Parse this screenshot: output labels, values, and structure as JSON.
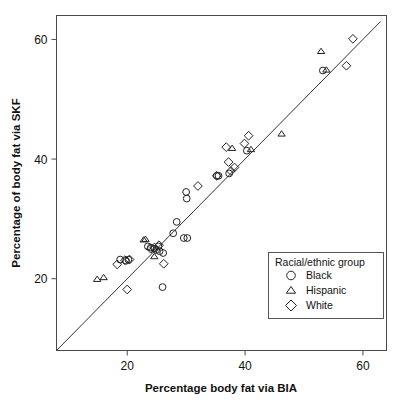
{
  "chart_data": {
    "type": "scatter",
    "title": "",
    "xlabel": "Percentage body fat via BIA",
    "ylabel": "Percentage of body fat via SKF",
    "xlim": [
      8,
      64
    ],
    "ylim": [
      8,
      64
    ],
    "xticks": [
      20,
      40,
      60
    ],
    "yticks": [
      20,
      40,
      60
    ],
    "xtick_labels": [
      "20",
      "40",
      "60"
    ],
    "ytick_labels": [
      "20",
      "40",
      "60"
    ],
    "grid": false,
    "reference_line": {
      "type": "identity",
      "label": "y = x",
      "from": [
        8,
        8
      ],
      "to": [
        63,
        63
      ]
    },
    "legend": {
      "title": "Racial/ethnic group",
      "position": "bottom-right",
      "entries": [
        {
          "name": "Black",
          "marker": "circle"
        },
        {
          "name": "Hispanic",
          "marker": "triangle"
        },
        {
          "name": "White",
          "marker": "diamond"
        }
      ]
    },
    "series": [
      {
        "name": "Black",
        "marker": "circle",
        "points": [
          [
            18.8,
            23.2
          ],
          [
            19.8,
            23.0
          ],
          [
            20.2,
            23.2
          ],
          [
            23.5,
            25.4
          ],
          [
            24.0,
            25.2
          ],
          [
            24.6,
            25.0
          ],
          [
            24.9,
            24.8
          ],
          [
            25.3,
            25.4
          ],
          [
            25.5,
            24.6
          ],
          [
            26.1,
            24.3
          ],
          [
            26.0,
            18.6
          ],
          [
            27.8,
            27.6
          ],
          [
            28.4,
            29.5
          ],
          [
            29.6,
            26.8
          ],
          [
            30.2,
            26.8
          ],
          [
            30.0,
            34.5
          ],
          [
            30.1,
            33.4
          ],
          [
            35.2,
            37.2
          ],
          [
            35.5,
            37.2
          ],
          [
            37.3,
            37.6
          ],
          [
            40.3,
            41.4
          ],
          [
            53.2,
            54.8
          ]
        ]
      },
      {
        "name": "Hispanic",
        "marker": "triangle",
        "points": [
          [
            14.9,
            19.9
          ],
          [
            16.0,
            20.2
          ],
          [
            22.8,
            26.5
          ],
          [
            23.1,
            26.6
          ],
          [
            24.6,
            23.7
          ],
          [
            37.8,
            41.8
          ],
          [
            41.0,
            41.6
          ],
          [
            46.2,
            44.2
          ],
          [
            52.9,
            58.0
          ],
          [
            53.8,
            54.9
          ]
        ]
      },
      {
        "name": "White",
        "marker": "diamond",
        "points": [
          [
            18.3,
            22.4
          ],
          [
            19.6,
            23.1
          ],
          [
            20.4,
            23.2
          ],
          [
            20.0,
            18.2
          ],
          [
            24.0,
            25.0
          ],
          [
            24.6,
            25.2
          ],
          [
            25.4,
            25.6
          ],
          [
            26.2,
            22.5
          ],
          [
            32.0,
            35.5
          ],
          [
            35.2,
            37.2
          ],
          [
            36.8,
            42.0
          ],
          [
            37.2,
            39.5
          ],
          [
            37.6,
            38.0
          ],
          [
            38.2,
            38.6
          ],
          [
            39.9,
            42.6
          ],
          [
            40.6,
            43.9
          ],
          [
            57.2,
            55.6
          ],
          [
            58.3,
            60.1
          ]
        ]
      }
    ]
  }
}
